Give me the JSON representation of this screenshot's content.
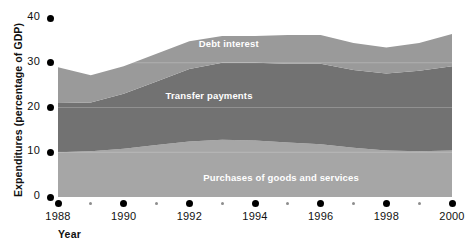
{
  "chart_data": {
    "type": "area",
    "title": "",
    "subtitle": "",
    "xlabel": "Year",
    "ylabel": "Expenditures (percentage of GDP)",
    "stacked": true,
    "grid": false,
    "legend_position": "inline-labels",
    "xlim": [
      1988,
      2000
    ],
    "ylim": [
      0,
      40
    ],
    "yticks": [
      0,
      10,
      20,
      30,
      40
    ],
    "ytick_labels": [
      "0",
      "10",
      "20",
      "30",
      "40"
    ],
    "xticks_major": [
      1988,
      1990,
      1992,
      1994,
      1996,
      1998,
      2000
    ],
    "xtick_major_labels": [
      "1988",
      "1990",
      "1992",
      "1994",
      "1996",
      "1998",
      "2000"
    ],
    "xticks_minor": [
      1989,
      1991,
      1993,
      1995,
      1997,
      1999
    ],
    "x": [
      1988,
      1989,
      1990,
      1991,
      1992,
      1993,
      1994,
      1995,
      1996,
      1997,
      1998,
      1999,
      2000
    ],
    "series": [
      {
        "name": "Purchases of goods and services",
        "color": "#a6a6a6",
        "values": [
          10.0,
          10.2,
          10.8,
          11.6,
          12.4,
          12.8,
          12.6,
          12.2,
          11.8,
          11.0,
          10.4,
          10.2,
          10.4
        ]
      },
      {
        "name": "Transfer payments",
        "color": "#727272",
        "values": [
          11.0,
          10.9,
          12.3,
          14.2,
          16.2,
          17.2,
          17.4,
          17.6,
          18.0,
          17.4,
          17.2,
          18.0,
          18.8
        ]
      },
      {
        "name": "Debt interest",
        "color": "#9a9a9a",
        "values": [
          8.0,
          6.1,
          6.1,
          6.2,
          6.2,
          6.0,
          6.0,
          6.4,
          6.4,
          6.0,
          5.8,
          6.2,
          7.2
        ]
      }
    ],
    "totals": [
      29.0,
      27.2,
      29.2,
      32.0,
      34.8,
      36.0,
      36.0,
      36.2,
      36.2,
      34.4,
      33.4,
      34.4,
      36.4
    ],
    "annotations": [
      {
        "text": "Debt interest",
        "x": 1993.2,
        "y": 34.2
      },
      {
        "text": "Transfer payments",
        "x": 1992.6,
        "y": 22.5
      },
      {
        "text": "Purchases of goods and services",
        "x": 1994.8,
        "y": 4.2
      }
    ]
  },
  "axis": {
    "y_title": "Expenditures (percentage of GDP)",
    "x_title": "Year"
  }
}
